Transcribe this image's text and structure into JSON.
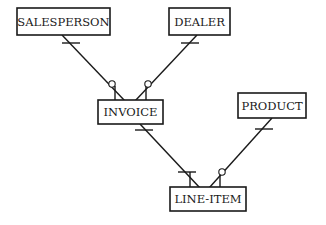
{
  "diagram": {
    "type": "entity-relationship",
    "notation": "crow's foot",
    "entities": [
      {
        "id": "salesperson",
        "label": "SALESPERSON",
        "x": 17,
        "y": 8,
        "w": 93,
        "h": 27
      },
      {
        "id": "dealer",
        "label": "DEALER",
        "x": 169,
        "y": 8,
        "w": 61,
        "h": 27
      },
      {
        "id": "invoice",
        "label": "INVOICE",
        "x": 98,
        "y": 100,
        "w": 65,
        "h": 24
      },
      {
        "id": "product",
        "label": "PRODUCT",
        "x": 238,
        "y": 93,
        "w": 68,
        "h": 25
      },
      {
        "id": "line_item",
        "label": "LINE-ITEM",
        "x": 170,
        "y": 187,
        "w": 76,
        "h": 24
      }
    ],
    "relationships": [
      {
        "from": "salesperson",
        "to": "invoice",
        "from_end": "one",
        "to_end": "zero-or-many"
      },
      {
        "from": "dealer",
        "to": "invoice",
        "from_end": "one",
        "to_end": "zero-or-many"
      },
      {
        "from": "invoice",
        "to": "line_item",
        "from_end": "one",
        "to_end": "one-or-many"
      },
      {
        "from": "product",
        "to": "line_item",
        "from_end": "one",
        "to_end": "zero-or-many"
      }
    ]
  }
}
